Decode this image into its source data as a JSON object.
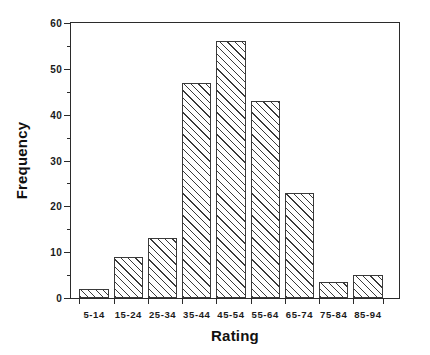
{
  "chart_data": {
    "type": "bar",
    "title": "",
    "xlabel": "Rating",
    "ylabel": "Frequency",
    "categories": [
      "5-14",
      "15-24",
      "25-34",
      "35-44",
      "45-54",
      "55-64",
      "65-74",
      "75-84",
      "85-94"
    ],
    "values": [
      2,
      9,
      13,
      47,
      56,
      43,
      23,
      3.5,
      5
    ],
    "ylim": [
      0,
      60
    ],
    "yticks": [
      0,
      10,
      20,
      30,
      40,
      50,
      60
    ],
    "ytick_labels": [
      "0",
      "10",
      "20",
      "30",
      "40",
      "50",
      "60"
    ],
    "yminor_ticks": [
      5,
      15,
      25,
      35,
      45,
      55
    ],
    "grid": false,
    "legend": false,
    "bar_fill": "diagonal-hatch",
    "bar_edge_color": "#3a3a3a",
    "axis_color": "#2b2b2b",
    "background_color": "#ffffff"
  }
}
